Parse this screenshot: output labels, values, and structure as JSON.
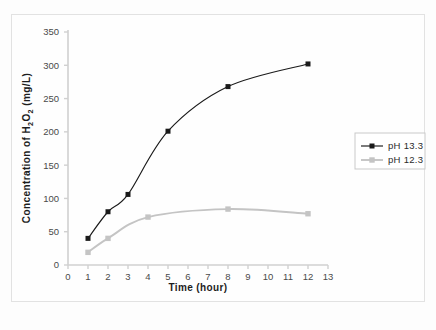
{
  "figure": {
    "background_color": "#fdfdfd",
    "frame_color": "#e2e2e2",
    "caption_partial": ""
  },
  "chart_data": {
    "type": "line",
    "title": "",
    "xlabel": "Time (hour)",
    "ylabel_parts": {
      "prefix": "Concentration of  H",
      "sub1": "2",
      "mid": "O",
      "sub2": "2",
      "suffix": " (mg/L)"
    },
    "ylabel": "Concentration of  H2O2 (mg/L)",
    "xlim": [
      0,
      13
    ],
    "ylim": [
      0,
      350
    ],
    "xticks": [
      0,
      1,
      2,
      3,
      4,
      5,
      6,
      7,
      8,
      9,
      10,
      11,
      12,
      13
    ],
    "yticks": [
      0,
      50,
      100,
      150,
      200,
      250,
      300,
      350
    ],
    "grid": false,
    "legend_position": "right",
    "series": [
      {
        "name": "pH 13.3",
        "color": "#1a1a1a",
        "marker": "square-filled",
        "x": [
          1,
          2,
          3,
          5,
          8,
          12
        ],
        "values": [
          40,
          80,
          106,
          201,
          268,
          302
        ]
      },
      {
        "name": "pH 12.3",
        "color": "#c4c4c4",
        "marker": "square-filled",
        "x": [
          1,
          2,
          4,
          8,
          12
        ],
        "values": [
          19,
          40,
          72,
          84,
          77
        ]
      }
    ]
  },
  "legend": {
    "items": [
      {
        "label": "pH 13.3"
      },
      {
        "label": "pH 12.3"
      }
    ]
  }
}
